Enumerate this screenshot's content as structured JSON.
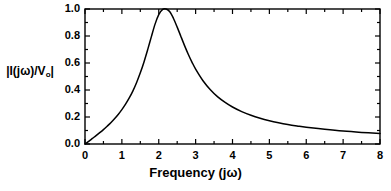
{
  "chart_data": {
    "type": "line",
    "title": "",
    "xlabel": "Frequency (jω)",
    "ylabel": "|I(jω)/V",
    "ylabel_sub": "o",
    "ylabel_suffix": "|",
    "ylabel_full": "|I(jω)/Vₒ|",
    "xlim": [
      0,
      8
    ],
    "ylim": [
      0.0,
      1.0
    ],
    "xticks": [
      0,
      1,
      2,
      3,
      4,
      5,
      6,
      7,
      8
    ],
    "xtick_labels": [
      "0",
      "1",
      "2",
      "3",
      "4",
      "5",
      "6",
      "7",
      "8"
    ],
    "yticks": [
      0.0,
      0.2,
      0.4,
      0.6,
      0.8,
      1.0
    ],
    "ytick_labels": [
      "0.0",
      "0.2",
      "0.4",
      "0.6",
      "0.8",
      "1.0"
    ],
    "minor_tick_interval_x": 0.5,
    "minor_tick_interval_y": 0.1,
    "grid": false,
    "legend": null,
    "line_color": "#000000",
    "axis_color": "#000000",
    "background_color": "#ffffff",
    "resonance_peak_x": 2.3,
    "resonance_peak_y": 1.0,
    "half_power_bandwidth": 1.1,
    "quality_factor": 2.09,
    "series": [
      {
        "name": "current magnitude",
        "x": [
          0.0,
          0.1,
          0.2,
          0.3,
          0.4,
          0.5,
          0.6,
          0.7,
          0.8,
          0.9,
          1.0,
          1.1,
          1.2,
          1.3,
          1.4,
          1.5,
          1.6,
          1.7,
          1.8,
          1.9,
          2.0,
          2.1,
          2.2,
          2.3,
          2.4,
          2.5,
          2.6,
          2.7,
          2.8,
          2.9,
          3.0,
          3.2,
          3.4,
          3.6,
          3.8,
          4.0,
          4.25,
          4.5,
          4.75,
          5.0,
          5.25,
          5.5,
          5.75,
          6.0,
          6.5,
          7.0,
          7.5,
          8.0
        ],
        "y": [
          0.0,
          0.02,
          0.041,
          0.062,
          0.084,
          0.107,
          0.132,
          0.158,
          0.187,
          0.219,
          0.255,
          0.295,
          0.341,
          0.394,
          0.456,
          0.527,
          0.608,
          0.699,
          0.795,
          0.888,
          0.958,
          0.996,
          1.0,
          0.98,
          0.93,
          0.866,
          0.797,
          0.729,
          0.665,
          0.607,
          0.555,
          0.469,
          0.402,
          0.349,
          0.308,
          0.274,
          0.24,
          0.213,
          0.191,
          0.173,
          0.158,
          0.145,
          0.134,
          0.124,
          0.109,
          0.096,
          0.086,
          0.078
        ]
      }
    ]
  },
  "axes": {
    "frame_left_px": 85,
    "frame_right_px": 380,
    "frame_top_px": 9,
    "frame_bottom_px": 144
  }
}
